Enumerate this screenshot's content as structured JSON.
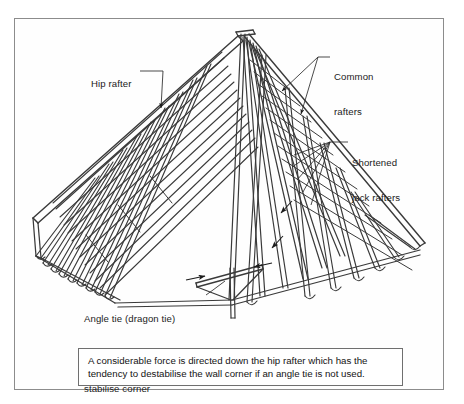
{
  "figure": {
    "type": "technical-line-drawing",
    "background_color": "#ffffff",
    "line_color": "#3a3a3a",
    "frame_color": "#8c8c8c",
    "text_color": "#1b1b1b"
  },
  "labels": {
    "hip_rafter": "Hip rafter",
    "common_rafters_line1": "Common",
    "common_rafters_line2": "rafters",
    "jack_rafters_line1": "Shortened",
    "jack_rafters_line2": "jack rafters",
    "angle_tie_line1": "Angle tie (dragon tie)",
    "angle_tie_line2": "across wallplate to",
    "angle_tie_line3": "stabilise corner"
  },
  "caption": {
    "line1": "A considerable force is directed down the hip rafter which has the",
    "line2": "tendency to destabilise the wall corner if an angle tie is not used."
  }
}
